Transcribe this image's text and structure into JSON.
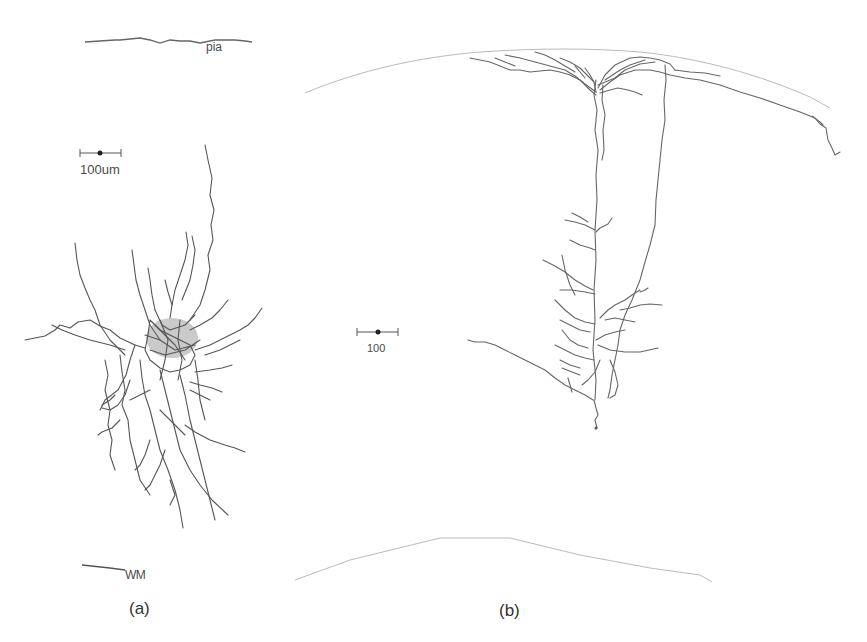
{
  "figure": {
    "panels": [
      {
        "id": "a",
        "caption": "(a)",
        "top_boundary_label": "pia",
        "bottom_boundary_label": "WM",
        "scale_bar_label": "100um"
      },
      {
        "id": "b",
        "caption": "(b)",
        "scale_bar_label": "100"
      }
    ],
    "colors": {
      "neuron": "#555555",
      "boundary_a": "#555555",
      "boundary_b": "#bbbbbb",
      "text": "#4a4a4a"
    }
  }
}
